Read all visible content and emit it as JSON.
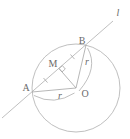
{
  "figure": {
    "type": "geometry-diagram",
    "labels": {
      "point_a": "A",
      "point_b": "B",
      "point_m": "M",
      "point_o": "O",
      "line_l": "l",
      "radius_ob": "r",
      "radius_oa": "r"
    },
    "colors": {
      "background": "#ffffff",
      "stroke": "#afafaf",
      "text": "#6a6a6a"
    }
  }
}
